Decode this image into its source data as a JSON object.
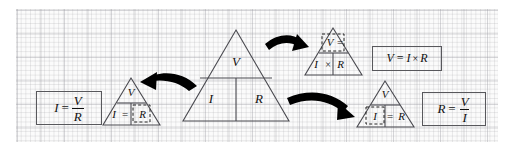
{
  "figure": {
    "name": "ohms-law-triangle-diagram",
    "background": "#fbfbfb",
    "grid_color": "#9a9aa2",
    "ink_color": "#111111",
    "arrow_color": "#000000"
  },
  "center_triangle": {
    "name": "ohms-law-triangle",
    "top_cell": "V",
    "bottom_left_cell": "I",
    "bottom_right_cell": "R"
  },
  "left_triangle": {
    "name": "cover-r-triangle",
    "top_cell": "V",
    "bottom_left_cell": "I",
    "operator": "=",
    "covered_cell": "R"
  },
  "left_box": {
    "name": "formula-i-equals-v-over-r",
    "lhs": "I",
    "equals": "=",
    "numerator": "V",
    "denominator": "R",
    "full_text": "I = V/R"
  },
  "top_right_triangle": {
    "name": "cover-v-triangle",
    "covered_cell": "V",
    "operator": "=",
    "bottom_left_cell": "I",
    "multiply": "×",
    "bottom_right_cell": "R"
  },
  "top_right_box": {
    "name": "formula-v-equals-i-times-r",
    "full_text": "V = I × R",
    "lhs": "V",
    "equals": "=",
    "rhs_left": "I",
    "multiply": "×",
    "rhs_right": "R"
  },
  "bottom_right_triangle": {
    "name": "cover-i-triangle",
    "top_cell": "V",
    "covered_cell": "I",
    "operator": "=",
    "bottom_right_cell": "R"
  },
  "bottom_right_box": {
    "name": "formula-r-equals-v-over-i",
    "lhs": "R",
    "equals": "=",
    "numerator": "V",
    "denominator": "I",
    "full_text": "R = V/I"
  },
  "arrows": [
    {
      "name": "arrow-to-left-triangle",
      "direction": "left"
    },
    {
      "name": "arrow-to-top-right-triangle",
      "direction": "right-up"
    },
    {
      "name": "arrow-to-bottom-right-triangle",
      "direction": "right-down"
    }
  ]
}
